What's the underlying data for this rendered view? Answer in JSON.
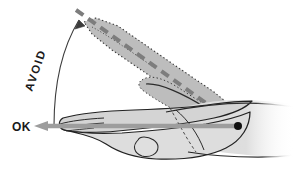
{
  "diagram": {
    "labels": {
      "avoid": "AVOID",
      "ok": "OK"
    },
    "annotations": {
      "pivot_name": "wrist-pivot-point",
      "arc_name": "rotation-angle-arc",
      "neutral_axis_name": "neutral-posture-axis",
      "deviated_axis_name": "extended-posture-axis"
    },
    "colors": {
      "outline": "#222222",
      "hand_fill": "#d6d6d6",
      "ghost_fill": "#b9b9b9",
      "arm_fill": "#dcdcdc",
      "neutral_arrow": "#9a9a9a",
      "dashed_axis": "#7d7d7d",
      "text": "#1a1a1a",
      "background": "#ffffff"
    },
    "geometry": {
      "pivot_x": 238,
      "pivot_y": 126,
      "avoid_rotation_deg": -71,
      "ok_arrow_tip_x": 36,
      "ok_arrow_y": 126
    }
  }
}
